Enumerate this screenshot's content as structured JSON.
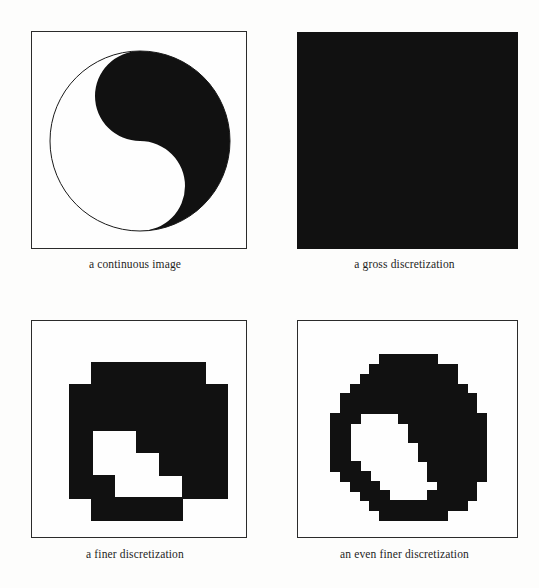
{
  "figure": {
    "background_color": "#fdfdfc",
    "ink_color": "#111111",
    "paper_color": "#fefefe",
    "frame_color": "#2b2b2b",
    "panel_count": 4
  },
  "panels": [
    {
      "id": "continuous-image",
      "caption": "a continuous image",
      "render": "yinyang-continuous",
      "frame": "outline",
      "box": {
        "x": 31,
        "y": 31,
        "w": 216,
        "h": 218
      },
      "circle": {
        "cx": 108,
        "cy": 109,
        "r": 90
      },
      "grid": null
    },
    {
      "id": "gross-discretization",
      "caption": "a gross discretization",
      "render": "solid-fill",
      "frame": "solid",
      "box": {
        "x": 297,
        "y": 32,
        "w": 221,
        "h": 217
      },
      "circle": null,
      "grid": {
        "cols": 1,
        "rows": 1,
        "cells": [
          [
            1
          ]
        ]
      }
    },
    {
      "id": "finer-discretization",
      "caption": "a finer discretization",
      "render": "pixel-grid",
      "frame": "outline",
      "box": {
        "x": 31,
        "y": 320,
        "w": 216,
        "h": 218
      },
      "circle": null,
      "grid": {
        "cols": 8,
        "rows": 8,
        "cell_px": 22.6,
        "origin": {
          "x": 14,
          "y": 18
        },
        "cells": [
          [
            0,
            0,
            0,
            0,
            0,
            0,
            0,
            0
          ],
          [
            0,
            0,
            1,
            1,
            1,
            1,
            1,
            0
          ],
          [
            0,
            1,
            1,
            1,
            1,
            1,
            1,
            1
          ],
          [
            0,
            1,
            1,
            1,
            1,
            1,
            1,
            1
          ],
          [
            0,
            1,
            0,
            0,
            1,
            1,
            1,
            1
          ],
          [
            0,
            1,
            0,
            0,
            0,
            1,
            1,
            1
          ],
          [
            0,
            1,
            1,
            0,
            0,
            0,
            1,
            1
          ],
          [
            0,
            0,
            1,
            1,
            1,
            1,
            0,
            0
          ]
        ]
      }
    },
    {
      "id": "even-finer-discretization",
      "caption": "an even finer discretization",
      "render": "pixel-grid",
      "frame": "outline",
      "box": {
        "x": 301,
        "y": 320,
        "w": 221,
        "h": 218
      },
      "circle": null,
      "grid": {
        "cols": 19,
        "rows": 19,
        "cell_px": 9.7,
        "origin": {
          "x": 13,
          "y": 14
        },
        "cells": [
          [
            0,
            0,
            0,
            0,
            0,
            0,
            0,
            0,
            0,
            0,
            0,
            0,
            0,
            0,
            0,
            0,
            0,
            0,
            0
          ],
          [
            0,
            0,
            0,
            0,
            0,
            0,
            0,
            0,
            0,
            0,
            0,
            0,
            0,
            0,
            0,
            0,
            0,
            0,
            0
          ],
          [
            0,
            0,
            0,
            0,
            0,
            0,
            0,
            1,
            1,
            1,
            1,
            1,
            1,
            0,
            0,
            0,
            0,
            0,
            0
          ],
          [
            0,
            0,
            0,
            0,
            0,
            0,
            1,
            1,
            1,
            1,
            1,
            1,
            1,
            1,
            1,
            0,
            0,
            0,
            0
          ],
          [
            0,
            0,
            0,
            0,
            0,
            1,
            1,
            1,
            1,
            1,
            1,
            1,
            1,
            1,
            1,
            0,
            0,
            0,
            0
          ],
          [
            0,
            0,
            0,
            0,
            1,
            1,
            1,
            1,
            1,
            1,
            1,
            1,
            1,
            1,
            1,
            1,
            0,
            0,
            0
          ],
          [
            0,
            0,
            0,
            1,
            1,
            1,
            1,
            1,
            1,
            1,
            1,
            1,
            1,
            1,
            1,
            1,
            1,
            0,
            0
          ],
          [
            0,
            0,
            0,
            1,
            1,
            1,
            1,
            1,
            1,
            1,
            1,
            1,
            1,
            1,
            1,
            1,
            1,
            0,
            0
          ],
          [
            0,
            0,
            1,
            1,
            1,
            0,
            0,
            0,
            0,
            1,
            1,
            1,
            1,
            1,
            1,
            1,
            1,
            1,
            0
          ],
          [
            0,
            0,
            1,
            1,
            0,
            0,
            0,
            0,
            0,
            0,
            1,
            1,
            1,
            1,
            1,
            1,
            1,
            1,
            0
          ],
          [
            0,
            0,
            1,
            1,
            0,
            0,
            0,
            0,
            0,
            0,
            1,
            1,
            1,
            1,
            1,
            1,
            1,
            1,
            0
          ],
          [
            0,
            0,
            1,
            1,
            0,
            0,
            0,
            0,
            0,
            0,
            0,
            1,
            1,
            1,
            1,
            1,
            1,
            1,
            0
          ],
          [
            0,
            0,
            1,
            1,
            0,
            0,
            0,
            0,
            0,
            0,
            0,
            1,
            1,
            1,
            1,
            1,
            1,
            1,
            0
          ],
          [
            0,
            0,
            1,
            1,
            1,
            0,
            0,
            0,
            0,
            0,
            0,
            0,
            1,
            1,
            1,
            1,
            1,
            1,
            0
          ],
          [
            0,
            0,
            0,
            1,
            1,
            1,
            0,
            0,
            0,
            0,
            0,
            0,
            1,
            1,
            1,
            1,
            1,
            1,
            0
          ],
          [
            0,
            0,
            0,
            0,
            1,
            1,
            1,
            0,
            0,
            0,
            0,
            0,
            0,
            1,
            1,
            1,
            1,
            0,
            0
          ],
          [
            0,
            0,
            0,
            0,
            0,
            1,
            1,
            1,
            0,
            0,
            0,
            0,
            1,
            1,
            1,
            1,
            1,
            0,
            0
          ],
          [
            0,
            0,
            0,
            0,
            0,
            0,
            1,
            1,
            1,
            1,
            1,
            1,
            1,
            1,
            1,
            1,
            0,
            0,
            0
          ],
          [
            0,
            0,
            0,
            0,
            0,
            0,
            0,
            1,
            1,
            1,
            1,
            1,
            1,
            1,
            0,
            0,
            0,
            0,
            0
          ]
        ]
      }
    }
  ]
}
